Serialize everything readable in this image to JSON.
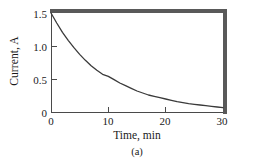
{
  "chart_data": {
    "type": "line",
    "title": "",
    "subtitle": "",
    "caption": "(a)",
    "xlabel": "Time, min",
    "ylabel": "Current, A",
    "xlim": [
      0,
      30
    ],
    "ylim": [
      0,
      1.5
    ],
    "xticks": [
      "0",
      "10",
      "20",
      "30"
    ],
    "xtick_values": [
      0,
      10,
      20,
      30
    ],
    "yticks": [
      "0",
      "0.5",
      "1.0",
      "1.5"
    ],
    "ytick_values": [
      0,
      0.5,
      1.0,
      1.5
    ],
    "grid": false,
    "legend": null,
    "line_color": "#3a3a3a",
    "line_width": 1.3,
    "series": [
      {
        "name": "Current",
        "x": [
          0,
          1,
          2,
          3,
          4,
          5,
          6,
          7,
          8,
          9,
          10,
          11,
          12,
          13,
          14,
          15,
          16,
          17,
          18,
          19,
          20,
          21,
          22,
          23,
          24,
          25,
          26,
          27,
          28,
          29,
          30
        ],
        "values": [
          1.5,
          1.35,
          1.21,
          1.09,
          0.98,
          0.88,
          0.79,
          0.71,
          0.64,
          0.58,
          0.55,
          0.5,
          0.45,
          0.41,
          0.37,
          0.33,
          0.3,
          0.27,
          0.25,
          0.23,
          0.21,
          0.19,
          0.17,
          0.155,
          0.14,
          0.13,
          0.12,
          0.11,
          0.1,
          0.09,
          0.08
        ]
      }
    ]
  },
  "figure": {
    "background": "#ffffff",
    "frame_color": "#595959",
    "axis_color": "#4a4a4a"
  }
}
